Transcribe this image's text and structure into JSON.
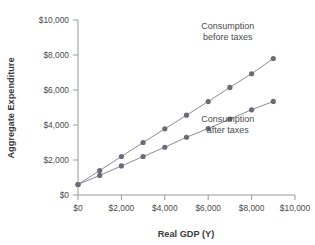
{
  "chart_data": {
    "type": "line",
    "title": "",
    "xlabel": "Real GDP (Y)",
    "ylabel": "Aggregate Expenditure",
    "xlim": [
      0,
      10000
    ],
    "ylim": [
      0,
      10000
    ],
    "grid": false,
    "legend_position": "inline-annotations",
    "x_ticks": [
      "$0",
      "$2,000",
      "$4,000",
      "$6,000",
      "$8,000",
      "$10,000"
    ],
    "x_tick_values": [
      0,
      2000,
      4000,
      6000,
      8000,
      10000
    ],
    "y_ticks": [
      "$0",
      "$2,000",
      "$4,000",
      "$6,000",
      "$8,000",
      "$10,000"
    ],
    "y_tick_values": [
      0,
      2000,
      4000,
      6000,
      8000,
      10000
    ],
    "x": [
      0,
      1000,
      2000,
      3000,
      4000,
      5000,
      6000,
      7000,
      8000,
      9000
    ],
    "series": [
      {
        "name": "Consumption before taxes",
        "values": [
          600,
          1400,
          2200,
          3000,
          3780,
          4560,
          5340,
          6150,
          6930,
          7800
        ],
        "color": "#6b6b78"
      },
      {
        "name": "Consumption after taxes",
        "values": [
          600,
          1120,
          1660,
          2200,
          2730,
          3300,
          3800,
          4340,
          4870,
          5350
        ],
        "color": "#6b6b78"
      }
    ],
    "annotations": [
      {
        "id": "annotation-before-taxes",
        "lines": [
          "Consumption",
          "before taxes"
        ],
        "x": 6900,
        "y": 9500
      },
      {
        "id": "annotation-after-taxes",
        "lines": [
          "Consumption",
          "after taxes"
        ],
        "x": 6900,
        "y": 4150
      }
    ]
  }
}
